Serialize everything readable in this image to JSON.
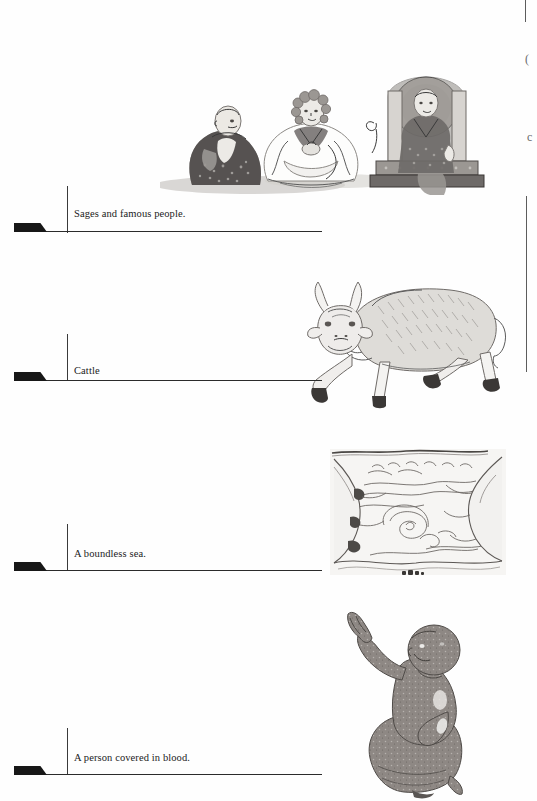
{
  "page": {
    "type": "scanned-book-page",
    "background_color": "#fefefe",
    "ink_color": "#1b1b1b",
    "width": 537,
    "height": 801
  },
  "entries": [
    {
      "id": "entry-1",
      "caption": "Sages and famous people.",
      "illustration_name": "three-seated-sages-illustration",
      "illustration_description": "Three seated robed figures, the rightmost enthroned with a nimbus"
    },
    {
      "id": "entry-2",
      "caption": "Cattle",
      "illustration_name": "bull-illustration",
      "illustration_description": "Line drawing of a horned bull striding to the left"
    },
    {
      "id": "entry-3",
      "caption": "A boundless sea.",
      "illustration_name": "boundless-sea-illustration",
      "illustration_description": "Water scene with waves, a whirlpool and rocky banks"
    },
    {
      "id": "entry-4",
      "caption": "A person covered in blood.",
      "illustration_name": "kneeling-blood-covered-person-illustration",
      "illustration_description": "Dark kneeling figure with one arm raised, palm outward"
    }
  ],
  "edge_artifacts": {
    "glyph_top": "(",
    "glyph_lower": "c"
  }
}
